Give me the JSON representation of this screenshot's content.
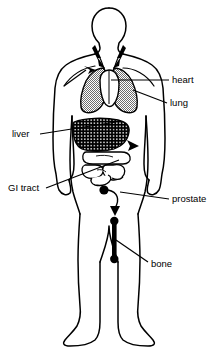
{
  "diagram": {
    "background_color": "#ffffff",
    "line_color": "#000000",
    "labels": [
      {
        "id": "heart",
        "text": "heart",
        "x": 172,
        "y": 83,
        "anchor": "start"
      },
      {
        "id": "lung",
        "text": "lung",
        "x": 170,
        "y": 106,
        "anchor": "start"
      },
      {
        "id": "liver",
        "text": "liver",
        "x": 12,
        "y": 137,
        "anchor": "start"
      },
      {
        "id": "gi-tract",
        "text": "GI tract",
        "x": 8,
        "y": 191,
        "anchor": "start"
      },
      {
        "id": "prostate",
        "text": "prostate",
        "x": 172,
        "y": 202,
        "anchor": "start"
      },
      {
        "id": "bone",
        "text": "bone",
        "x": 151,
        "y": 267,
        "anchor": "start"
      }
    ],
    "organs": [
      {
        "id": "heart",
        "name": "heart",
        "fill": "#ffffff",
        "pattern": "none"
      },
      {
        "id": "lung",
        "name": "lung",
        "fill": "#9a9a9a",
        "pattern": "stipple"
      },
      {
        "id": "liver",
        "name": "liver",
        "fill": "#000000",
        "pattern": "dots"
      },
      {
        "id": "gi-tract",
        "name": "GI tract",
        "fill": "#ffffff",
        "pattern": "none"
      },
      {
        "id": "prostate",
        "name": "prostate",
        "fill": "#000000",
        "pattern": "solid"
      },
      {
        "id": "bone",
        "name": "bone",
        "fill": "#000000",
        "pattern": "solid"
      }
    ],
    "colors": {
      "outline": "#000000",
      "lung_fill": "#9a9a9a",
      "liver_fill": "#000000",
      "page_background": "#ffffff"
    }
  }
}
